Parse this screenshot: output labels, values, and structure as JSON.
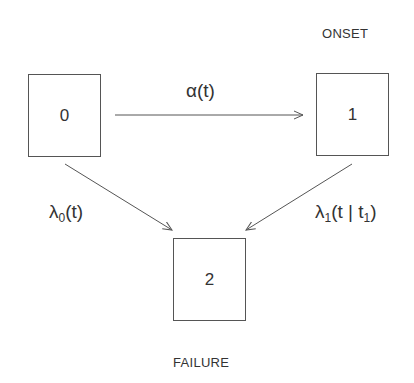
{
  "states": [
    {
      "id": "0",
      "label": ""
    },
    {
      "id": "1",
      "label": "ONSET"
    },
    {
      "id": "2",
      "label": "FAILURE"
    }
  ],
  "transitions": [
    {
      "from": "0",
      "to": "1",
      "symbol": "α",
      "sub": "",
      "args": "(t)"
    },
    {
      "from": "0",
      "to": "2",
      "symbol": "λ",
      "sub": "0",
      "args": "(t)"
    },
    {
      "from": "1",
      "to": "2",
      "symbol": "λ",
      "sub": "1",
      "args_pre": "(t | t",
      "args_sub": "1",
      "args_post": ")"
    }
  ],
  "colors": {
    "line": "#555555",
    "text": "#333333",
    "background": "#ffffff"
  }
}
